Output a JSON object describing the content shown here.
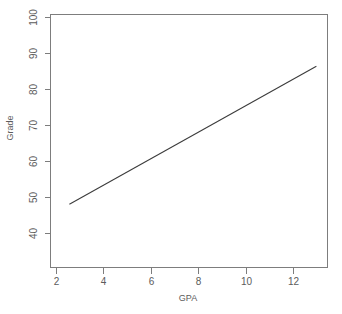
{
  "chart_data": {
    "type": "line",
    "title": "",
    "xlabel": "GPA",
    "ylabel": "Grade",
    "xlim": [
      1.15,
      13.6
    ],
    "ylim": [
      36.5,
      102.5
    ],
    "xticks": [
      2,
      4,
      6,
      8,
      10,
      12
    ],
    "xtick_labels": [
      "2",
      "4",
      "6",
      "8",
      "10",
      "12"
    ],
    "yticks": [
      40,
      50,
      60,
      70,
      80,
      90,
      100
    ],
    "ytick_labels": [
      "40",
      "50",
      "60",
      "70",
      "80",
      "90",
      "100"
    ],
    "grid": false,
    "legend": null,
    "box": true,
    "series": [
      {
        "name": "regression-line",
        "x": [
          2.0,
          13.1
        ],
        "values": [
          53.0,
          89.0
        ]
      }
    ],
    "colors": {
      "line": "#3c3c3c",
      "axis": "#7d7d7d",
      "text": "#5c5c5c",
      "background": "#ffffff"
    }
  },
  "labels": {
    "y_100": "100",
    "y_90": "90",
    "y_80": "80",
    "y_70": "70",
    "y_60": "60",
    "y_50": "50",
    "y_40": "40",
    "x_2": "2",
    "x_4": "4",
    "x_6": "6",
    "x_8": "8",
    "x_10": "10",
    "x_12": "12",
    "x_axis_title": "GPA",
    "y_axis_title": "Grade"
  }
}
